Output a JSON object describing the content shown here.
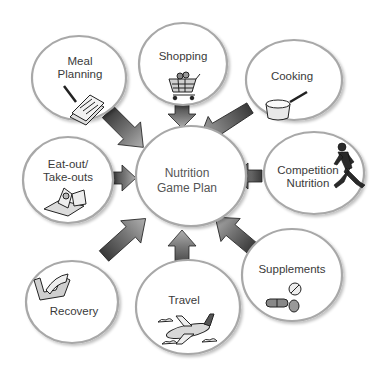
{
  "diagram": {
    "type": "hub-and-spoke",
    "center": {
      "label_line1": "Nutrition",
      "label_line2": "Game Plan"
    },
    "nodes": [
      {
        "id": "meal-planning",
        "label_line1": "Meal",
        "label_line2": "Planning",
        "icon": "notepad-pencil-icon"
      },
      {
        "id": "shopping",
        "label_line1": "Shopping",
        "label_line2": "",
        "icon": "shopping-cart-icon"
      },
      {
        "id": "cooking",
        "label_line1": "Cooking",
        "label_line2": "",
        "icon": "saucepan-icon"
      },
      {
        "id": "eat-out",
        "label_line1": "Eat-out/",
        "label_line2": "Take-outs",
        "icon": "takeout-box-icon"
      },
      {
        "id": "competition-nutrition",
        "label_line1": "Competition",
        "label_line2": "Nutrition",
        "icon": "runner-icon"
      },
      {
        "id": "recovery",
        "label_line1": "Recovery",
        "label_line2": "",
        "icon": "flexed-arm-icon"
      },
      {
        "id": "travel",
        "label_line1": "Travel",
        "label_line2": "",
        "icon": "airplane-icon"
      },
      {
        "id": "supplements",
        "label_line1": "Supplements",
        "label_line2": "",
        "icon": "pills-icon"
      }
    ],
    "edges": [
      {
        "from": "meal-planning",
        "to": "center"
      },
      {
        "from": "shopping",
        "to": "center"
      },
      {
        "from": "cooking",
        "to": "center"
      },
      {
        "from": "eat-out",
        "to": "center"
      },
      {
        "from": "competition-nutrition",
        "to": "center"
      },
      {
        "from": "recovery",
        "to": "center"
      },
      {
        "from": "travel",
        "to": "center"
      },
      {
        "from": "supplements",
        "to": "center"
      }
    ],
    "colors": {
      "circle_stroke": "#a8a8a8",
      "arrow_dark": "#3c3c3c",
      "arrow_light": "#9a9a9a",
      "text": "#3a3a3a"
    }
  }
}
